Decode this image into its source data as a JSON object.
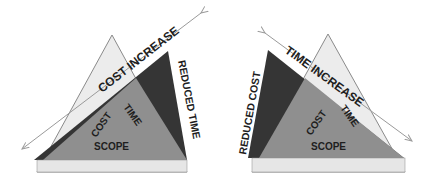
{
  "diagrams": [
    {
      "id": "left",
      "center_labels": {
        "cost": "COST",
        "time": "TIME",
        "scope": "SCOPE"
      },
      "arrow_label": "COST INCREASE",
      "side_label": "REDUCED TIME"
    },
    {
      "id": "right",
      "center_labels": {
        "cost": "COST",
        "time": "TIME",
        "scope": "SCOPE"
      },
      "arrow_label": "TIME INCREASE",
      "side_label": "REDUCED COST"
    }
  ],
  "colors": {
    "light_triangle_fill": "#ececec",
    "light_triangle_stroke": "#8a8a8a",
    "mid_gray": "#8f8f8f",
    "dark_wedge": "#353535",
    "base_band": "#e6e6e6",
    "arrow": "#9a9a9a",
    "text": "#1e1e1e"
  }
}
